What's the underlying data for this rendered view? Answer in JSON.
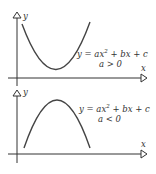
{
  "graphs": [
    {
      "axis_x_label": "x",
      "axis_y_label": "y",
      "equation": "y = ax² + bx + c",
      "eq_prefix": "y = ax",
      "eq_exp": "2",
      "eq_suffix": " + bx + c",
      "condition": "a > 0",
      "shape": "parabola opening upward"
    },
    {
      "axis_x_label": "x",
      "axis_y_label": "y",
      "equation": "y = ax² + bx + c",
      "eq_prefix": "y = ax",
      "eq_exp": "2",
      "eq_suffix": " + bx + c",
      "condition": "a < 0",
      "shape": "parabola opening downward"
    }
  ]
}
